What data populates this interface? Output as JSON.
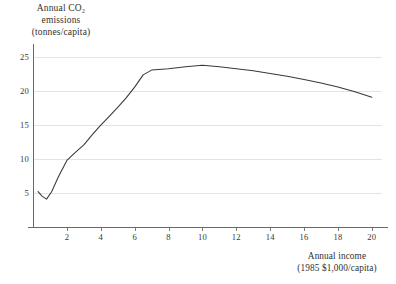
{
  "chart_data": {
    "type": "line",
    "title": "",
    "ylabel_lines": [
      "Annual CO₂",
      "emissions",
      "(tonnes/capita)"
    ],
    "xlabel_lines": [
      "Annual income",
      "(1985 $1,000/capita)"
    ],
    "ylabel": "Annual CO2 emissions (tonnes/capita)",
    "xlabel": "Annual income (1985 $1,000/capita)",
    "xlim": [
      0,
      20.6
    ],
    "ylim": [
      0,
      26.5
    ],
    "xticks": [
      2,
      4,
      6,
      8,
      10,
      12,
      14,
      16,
      18,
      20
    ],
    "xtick_labels": [
      "2",
      "4",
      "6",
      "8",
      "10",
      "12",
      "14",
      "16",
      "18",
      "20"
    ],
    "yticks": [
      5,
      10,
      15,
      20,
      25
    ],
    "ytick_labels": [
      "5",
      "10",
      "15",
      "20",
      "25"
    ],
    "grid": "horizontal",
    "legend": null,
    "series": [
      {
        "name": "CO2 emissions vs income",
        "color": "#3b3835",
        "x": [
          0.3,
          0.55,
          0.8,
          1.1,
          1.5,
          2.0,
          2.5,
          3.0,
          3.5,
          4.0,
          4.5,
          5.0,
          5.5,
          6.0,
          6.5,
          7.0,
          8.0,
          9.0,
          10.0,
          11.0,
          12.0,
          13.0,
          14.0,
          15.0,
          16.0,
          17.0,
          18.0,
          19.0,
          20.0
        ],
        "y": [
          5.2,
          4.5,
          4.1,
          5.2,
          7.4,
          9.8,
          11.0,
          12.1,
          13.6,
          15.0,
          16.3,
          17.6,
          19.0,
          20.6,
          22.4,
          23.1,
          23.3,
          23.6,
          23.8,
          23.6,
          23.3,
          23.0,
          22.6,
          22.2,
          21.7,
          21.2,
          20.6,
          19.9,
          19.1
        ]
      }
    ]
  },
  "colors": {
    "background": "#ffffff",
    "axis": "#6a6765",
    "grid": "#e3e3e3",
    "curve": "#3b3835",
    "text": "#33302e"
  }
}
